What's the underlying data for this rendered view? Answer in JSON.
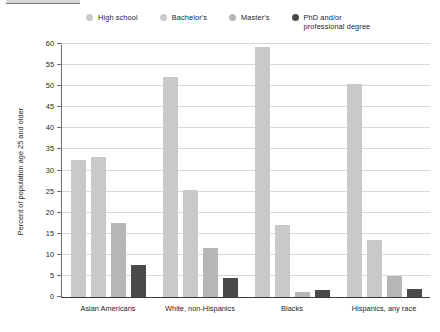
{
  "chart_data": {
    "type": "bar",
    "title": "",
    "subtitle": "",
    "xlabel": "",
    "ylabel": "Percent of population age 25 and older",
    "ylim": [
      0,
      60
    ],
    "ytick_step": 5,
    "yticks": [
      "0",
      "5",
      "10",
      "15",
      "20",
      "25",
      "30",
      "35",
      "40",
      "45",
      "50",
      "55",
      "60"
    ],
    "grid": true,
    "legend_position": "top",
    "categories": [
      "Asian Americans",
      "White, non-Hispanics",
      "Blacks",
      "Hispanics, any race"
    ],
    "series": [
      {
        "name": "High school",
        "color": "#c9c9c9",
        "values": [
          32.5,
          52.2,
          59.2,
          50.6
        ]
      },
      {
        "name": "Bachelor's",
        "color": "#c9c9c9",
        "values": [
          33.3,
          25.3,
          17.0,
          13.5
        ]
      },
      {
        "name": "Master's",
        "color": "#b6b6b6",
        "values": [
          17.6,
          11.6,
          1.1,
          5.0
        ]
      },
      {
        "name": "PhD and/or\nprofessional degree",
        "color": "#4a4a4a",
        "values": [
          7.5,
          4.4,
          1.6,
          1.8
        ]
      }
    ]
  },
  "colors": {
    "background": "#ffffff",
    "gridline": "#d7d7d7",
    "axis": "#3a3a3a",
    "text": "#1d1d1d",
    "bar_light": "#c9c9c9",
    "bar_medium": "#b6b6b6",
    "bar_dark": "#4a4a4a"
  }
}
